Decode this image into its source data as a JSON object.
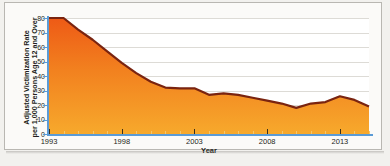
{
  "chart_data": {
    "type": "area",
    "title": "",
    "xlabel": "Year",
    "ylabel": "Adjusted Victimization Rate per 1,000 Persons Age 12 and Over",
    "ylabel_line1": "Adjusted Victimization Rate",
    "ylabel_line2": "per 1,000 Persons Age 12 and Over",
    "xlim": [
      1993,
      2015
    ],
    "ylim": [
      0,
      80
    ],
    "grid": true,
    "legend": "none",
    "yticks": [
      0,
      10,
      20,
      30,
      40,
      50,
      60,
      70,
      80
    ],
    "ytick_labels": [
      "0",
      "10",
      "20",
      "30",
      "40",
      "50",
      "60",
      "70",
      "80"
    ],
    "xticks": [
      1993,
      1998,
      2003,
      2008,
      2013
    ],
    "xtick_labels": [
      "1993",
      "1998",
      "2003",
      "2008",
      "2013"
    ],
    "x": [
      1993,
      1994,
      1995,
      1996,
      1997,
      1998,
      1999,
      2000,
      2001,
      2002,
      2003,
      2004,
      2005,
      2006,
      2007,
      2008,
      2009,
      2010,
      2011,
      2012,
      2013,
      2014,
      2015
    ],
    "values": [
      80,
      80,
      72,
      65,
      57,
      49,
      42,
      36,
      32,
      31.5,
      31.5,
      27,
      28,
      27,
      25,
      23,
      21,
      18,
      21,
      22,
      26,
      23.5,
      19
    ],
    "series": [
      {
        "name": "Adjusted victimization rate",
        "values": [
          80,
          80,
          72,
          65,
          57,
          49,
          42,
          36,
          32,
          31.5,
          31.5,
          27,
          28,
          27,
          25,
          23,
          21,
          18,
          21,
          22,
          26,
          23.5,
          19
        ]
      }
    ],
    "colors": {
      "area_top": "#ef5c18",
      "area_bottom": "#f6a227",
      "line": "#7a2410",
      "axis": "#5b9bd5",
      "grid": "#dddbd6",
      "text": "#231f20",
      "plot_background": "#ffffff",
      "page_background": "#fbfaf8"
    }
  }
}
